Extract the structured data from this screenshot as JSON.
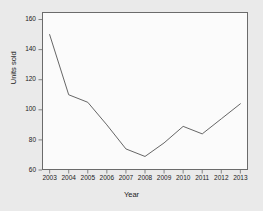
{
  "chart_data": {
    "type": "line",
    "title": "",
    "xlabel": "Year",
    "ylabel": "Units sold",
    "categories": [
      "2003",
      "2004",
      "2005",
      "2006",
      "2007",
      "2008",
      "2009",
      "2010",
      "2011",
      "2012",
      "2013"
    ],
    "x": [
      2003,
      2004,
      2005,
      2006,
      2007,
      2008,
      2009,
      2010,
      2011,
      2012,
      2013
    ],
    "values": [
      150,
      110,
      105,
      90,
      74,
      69,
      78,
      89,
      84,
      94,
      104
    ],
    "series": [
      {
        "name": "Units sold",
        "values": [
          150,
          110,
          105,
          90,
          74,
          69,
          78,
          89,
          84,
          94,
          104
        ]
      }
    ],
    "ylim": [
      60,
      165
    ],
    "xlim": [
      2002.6,
      2013.4
    ],
    "yticks": [
      60,
      80,
      100,
      120,
      140,
      160
    ],
    "ytick_labels": [
      "60",
      "80",
      "100",
      "120",
      "140",
      "160"
    ],
    "xticks": [
      2003,
      2004,
      2005,
      2006,
      2007,
      2008,
      2009,
      2010,
      2011,
      2012,
      2013
    ],
    "xtick_labels": [
      "2003",
      "2004",
      "2005",
      "2006",
      "2007",
      "2008",
      "2009",
      "2010",
      "2011",
      "2012",
      "2013"
    ],
    "grid": false,
    "legend": false,
    "legend_position": "none",
    "line_color": "#555555",
    "panel_background": "#fbfbfb",
    "figure_background": "#eaeaea",
    "axis_color": "#6b6b6b",
    "text_color": "#1a1a1a"
  }
}
